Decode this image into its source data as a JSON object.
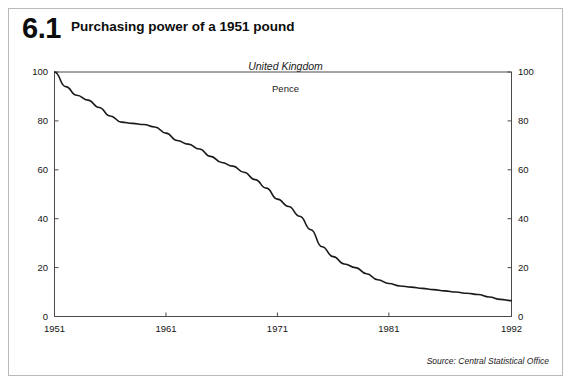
{
  "figure": {
    "number": "6.1",
    "title": "Purchasing power of a 1951 pound",
    "region": "United Kingdom",
    "unit": "Pence",
    "source": "Source: Central Statistical Office"
  },
  "chart_data": {
    "type": "line",
    "title": "Purchasing power of a 1951 pound",
    "subtitle": "United Kingdom",
    "xlabel": "",
    "ylabel": "Pence",
    "xlim": [
      1951,
      1992
    ],
    "ylim": [
      0,
      100
    ],
    "grid": false,
    "legend": null,
    "xticks": [
      "1951",
      "1961",
      "1971",
      "1981",
      "1992"
    ],
    "xtick_values": [
      1951,
      1961,
      1971,
      1981,
      1992
    ],
    "yticks": [
      "0",
      "20",
      "40",
      "60",
      "80",
      "100"
    ],
    "ytick_values": [
      0,
      20,
      40,
      60,
      80,
      100
    ],
    "y_axis_right_mirrored": true,
    "line_color": "#1a1a1a",
    "series": [
      {
        "name": "Purchasing power of a 1951 pound (pence)",
        "x": [
          1951,
          1952,
          1953,
          1954,
          1955,
          1956,
          1957,
          1958,
          1959,
          1960,
          1961,
          1962,
          1963,
          1964,
          1965,
          1966,
          1967,
          1968,
          1969,
          1970,
          1971,
          1972,
          1973,
          1974,
          1975,
          1976,
          1977,
          1978,
          1979,
          1980,
          1981,
          1982,
          1983,
          1984,
          1985,
          1986,
          1987,
          1988,
          1989,
          1990,
          1991,
          1992
        ],
        "values": [
          100.0,
          94.0,
          90.5,
          88.5,
          85.5,
          82.0,
          79.5,
          79.0,
          78.5,
          77.5,
          75.0,
          72.0,
          70.5,
          68.5,
          65.5,
          63.0,
          61.5,
          59.0,
          56.0,
          52.5,
          48.0,
          45.0,
          41.0,
          35.5,
          28.5,
          24.5,
          21.5,
          20.0,
          17.5,
          15.0,
          13.5,
          12.5,
          12.0,
          11.5,
          11.0,
          10.5,
          10.0,
          9.5,
          9.0,
          8.0,
          7.0,
          6.5
        ]
      }
    ]
  },
  "axis_render": {
    "x_min": 1951,
    "x_max": 1992,
    "y_min": 0,
    "y_max": 100
  }
}
